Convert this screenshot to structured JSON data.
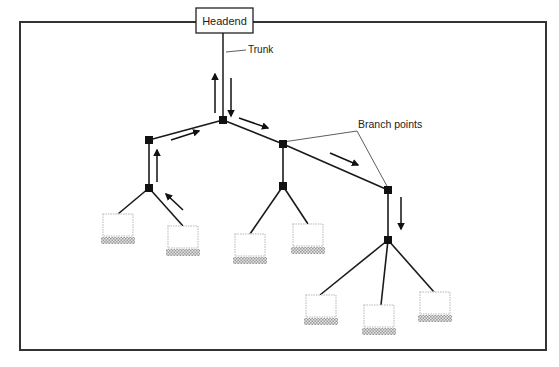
{
  "diagram": {
    "title_box": {
      "label": "Headend"
    },
    "labels": {
      "trunk": "Trunk",
      "branch_points": "Branch points"
    },
    "colors": {
      "line": "#1a1a1a",
      "frame": "#333333",
      "node": "#111111",
      "laptop_outline": "#c8c8c8",
      "laptop_keyboard": "#bdbdbd"
    },
    "nodes": [
      {
        "id": "trunk-hub",
        "x": 223,
        "y": 120
      },
      {
        "id": "left-branch",
        "x": 149,
        "y": 140
      },
      {
        "id": "left-tap",
        "x": 149,
        "y": 188
      },
      {
        "id": "mid-branch",
        "x": 283,
        "y": 144
      },
      {
        "id": "mid-tap",
        "x": 283,
        "y": 186
      },
      {
        "id": "right-branch",
        "x": 388,
        "y": 190
      },
      {
        "id": "right-tap",
        "x": 388,
        "y": 240
      }
    ],
    "devices": [
      {
        "id": "pc-1",
        "x": 102,
        "y": 214
      },
      {
        "id": "pc-2",
        "x": 166,
        "y": 226
      },
      {
        "id": "pc-3",
        "x": 234,
        "y": 234
      },
      {
        "id": "pc-4",
        "x": 291,
        "y": 224
      },
      {
        "id": "pc-5",
        "x": 305,
        "y": 295
      },
      {
        "id": "pc-6",
        "x": 362,
        "y": 305
      },
      {
        "id": "pc-7",
        "x": 418,
        "y": 292
      }
    ]
  }
}
